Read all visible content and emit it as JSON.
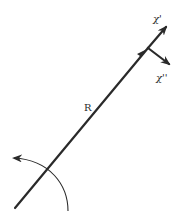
{
  "diagram": {
    "background": "#ffffff",
    "stroke_color": "#2a2a2a",
    "labels": {
      "vector_R": "R",
      "chi_prime": "χ'",
      "chi_double_prime": "χ''"
    },
    "elements": [
      {
        "id": "vector-R",
        "type": "arrow-line",
        "from": [
          15,
          208
        ],
        "to": [
          147,
          50
        ],
        "label": "R"
      },
      {
        "id": "chi-prime-arrow",
        "type": "arrow",
        "from": [
          148,
          48
        ],
        "to": [
          168,
          25
        ],
        "label": "χ'"
      },
      {
        "id": "chi-double-prime-arrow",
        "type": "arrow",
        "from": [
          148,
          48
        ],
        "to": [
          172,
          66
        ],
        "label": "χ''"
      },
      {
        "id": "rotation-arc",
        "type": "curved-arrow",
        "from": [
          68,
          210
        ],
        "to": [
          10,
          157
        ],
        "direction": "counter-clockwise"
      }
    ]
  }
}
